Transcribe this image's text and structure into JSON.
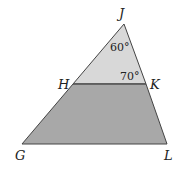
{
  "diagram": {
    "type": "triangle-with-parallel-segment",
    "vertices": {
      "J": {
        "label": "J",
        "x": 124,
        "y": 24
      },
      "H": {
        "label": "H",
        "x": 73,
        "y": 84
      },
      "K": {
        "label": "K",
        "x": 146,
        "y": 84
      },
      "G": {
        "label": "G",
        "x": 22,
        "y": 144
      },
      "L": {
        "label": "L",
        "x": 167,
        "y": 144
      }
    },
    "angles": {
      "J": "60°",
      "K": "70°"
    },
    "colors": {
      "upper_fill": "#d8d8d8",
      "lower_fill": "#a8a8a8",
      "stroke": "#444444"
    }
  }
}
